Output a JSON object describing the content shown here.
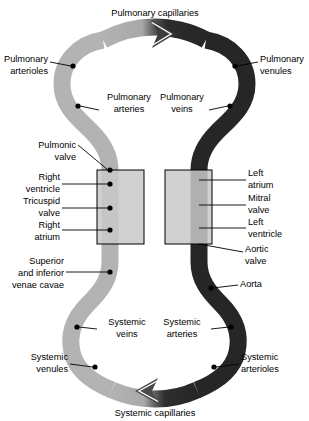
{
  "diagram": {
    "colors": {
      "deoxygenated_vessel": "#b3b3b3",
      "oxygenated_vessel": "#262626",
      "chamber_box_fill": "#c9c9c9",
      "chamber_box_stroke": "#000000",
      "background": "#ffffff",
      "text": "#000000",
      "arrow_outline": "#ffffff"
    },
    "labels": {
      "pulmonary_capillaries": "Pulmonary capillaries",
      "pulmonary_arterioles": [
        "Pulmonary",
        "arterioles"
      ],
      "pulmonary_venules": [
        "Pulmonary",
        "venules"
      ],
      "pulmonary_arteries": [
        "Pulmonary",
        "arteries"
      ],
      "pulmonary_veins": [
        "Pulmonary",
        "veins"
      ],
      "pulmonic_valve": [
        "Pulmonic",
        "valve"
      ],
      "right_ventricle": [
        "Right",
        "ventricle"
      ],
      "tricuspid_valve": [
        "Tricuspid",
        "valve"
      ],
      "right_atrium": [
        "Right",
        "atrium"
      ],
      "venae_cavae": [
        "Superior",
        "and inferior",
        "venae cavae"
      ],
      "left_atrium": [
        "Left",
        "atrium"
      ],
      "mitral_valve": [
        "Mitral",
        "valve"
      ],
      "left_ventricle": [
        "Left",
        "ventricle"
      ],
      "aortic_valve": [
        "Aortic",
        "valve"
      ],
      "aorta": "Aorta",
      "systemic_veins": [
        "Systemic",
        "veins"
      ],
      "systemic_arteries": [
        "Systemic",
        "arteries"
      ],
      "systemic_venules": [
        "Systemic",
        "venules"
      ],
      "systemic_arterioles": [
        "Systemic",
        "arterioles"
      ],
      "systemic_capillaries": "Systemic capillaries"
    },
    "flow_arrows": [
      {
        "name": "pulmonary-capillaries-arrow",
        "direction": "right",
        "position": "top"
      },
      {
        "name": "systemic-capillaries-arrow",
        "direction": "left",
        "position": "bottom"
      }
    ],
    "chambers": [
      {
        "name": "right-heart-box",
        "side": "left"
      },
      {
        "name": "left-heart-box",
        "side": "right"
      }
    ]
  }
}
